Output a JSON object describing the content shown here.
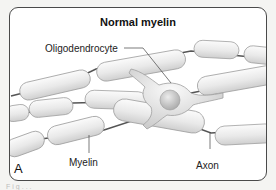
{
  "figure": {
    "title": "Normal myelin",
    "panel_letter": "A",
    "labels": {
      "oligodendrocyte": "Oligodendrocyte",
      "myelin": "Myelin",
      "axon": "Axon"
    },
    "caption_fragment": "Fig..."
  },
  "colors": {
    "frame_border": "#4a4a4a",
    "background": "#ffffff",
    "sheath_fill": "#eeeeee",
    "sheath_stroke": "#9a9a9a",
    "axon_line": "#555555",
    "node": "#6e6e6e"
  }
}
